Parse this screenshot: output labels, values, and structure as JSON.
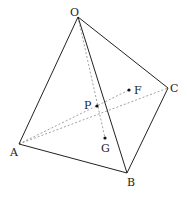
{
  "diagram": {
    "type": "tetrahedron",
    "vertices": {
      "O": {
        "label": "O",
        "x": 78,
        "y": 17
      },
      "A": {
        "label": "A",
        "x": 19,
        "y": 144
      },
      "B": {
        "label": "B",
        "x": 127,
        "y": 173
      },
      "C": {
        "label": "C",
        "x": 168,
        "y": 88
      }
    },
    "points": {
      "F": {
        "label": "F",
        "x": 129,
        "y": 90
      },
      "P": {
        "label": "P",
        "subscript": "",
        "x": 97,
        "y": 106
      },
      "G": {
        "label": "G",
        "x": 105,
        "y": 138
      }
    },
    "solid_edges": [
      "O-A",
      "O-B",
      "O-C",
      "A-B",
      "B-C"
    ],
    "dashed_edges": [
      "A-C",
      "O-G",
      "A-F"
    ],
    "colors": {
      "stroke": "#222222",
      "dashed": "#777777",
      "text": "#222222"
    }
  }
}
